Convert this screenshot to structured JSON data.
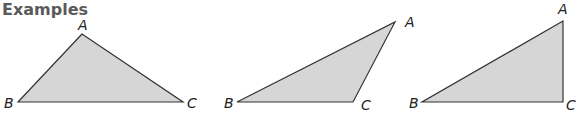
{
  "heading": "Examples",
  "colors": {
    "fill": "#d6d6d6",
    "stroke": "#333333",
    "heading": "#5a5a5a",
    "label": "#222222"
  },
  "triangles": [
    {
      "name": "obtuse-apex-triangle",
      "points": "82,34 18,102 183,102",
      "labels": [
        {
          "text": "A",
          "x": 78,
          "y": 30
        },
        {
          "text": "B",
          "x": 4,
          "y": 108
        },
        {
          "text": "C",
          "x": 187,
          "y": 108
        }
      ]
    },
    {
      "name": "obtuse-triangle",
      "points": "237,102 353,102 395,22",
      "labels": [
        {
          "text": "B",
          "x": 224,
          "y": 108
        },
        {
          "text": "C",
          "x": 361,
          "y": 110
        },
        {
          "text": "A",
          "x": 405,
          "y": 27
        }
      ]
    },
    {
      "name": "right-triangle",
      "points": "422,102 563,102 563,21",
      "labels": [
        {
          "text": "B",
          "x": 409,
          "y": 108
        },
        {
          "text": "C",
          "x": 566,
          "y": 110
        },
        {
          "text": "A",
          "x": 558,
          "y": 14
        }
      ]
    }
  ]
}
